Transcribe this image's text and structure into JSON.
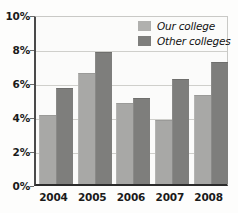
{
  "chart_data": {
    "type": "bar",
    "title": "",
    "subtitle": "",
    "xlabel": "",
    "ylabel": "",
    "categories": [
      "2004",
      "2005",
      "2006",
      "2007",
      "2008"
    ],
    "series": [
      {
        "name": "Our college",
        "color": "#a8a8a6",
        "values": [
          4.0,
          6.5,
          4.7,
          3.7,
          5.2
        ]
      },
      {
        "name": "Other colleges",
        "color": "#7e7e7c",
        "values": [
          5.6,
          7.7,
          5.0,
          6.1,
          7.1
        ]
      }
    ],
    "ylim": [
      0,
      10
    ],
    "ytick_values": [
      0,
      2,
      4,
      6,
      8,
      10
    ],
    "ytick_labels": [
      "0%",
      "2%",
      "4%",
      "6%",
      "8%",
      "10%"
    ],
    "grid": true,
    "grid_axis": "y",
    "legend_position": "top-right",
    "value_unit": "%"
  },
  "legend": {
    "items": [
      {
        "label": "Our college"
      },
      {
        "label": "Other colleges"
      }
    ]
  }
}
